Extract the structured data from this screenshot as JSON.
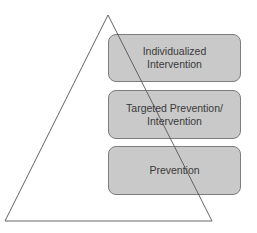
{
  "diagram": {
    "type": "pyramid-tiers",
    "shape": "triangle",
    "tiers": [
      {
        "label": "Individualized\nIntervention",
        "level": "top"
      },
      {
        "label": "Targeted Prevention/\nIntervention",
        "level": "middle"
      },
      {
        "label": "Prevention",
        "level": "bottom"
      }
    ],
    "colors": {
      "box_fill": "#c9c9c9",
      "box_border": "#7d7d7d",
      "text": "#3a3a3a",
      "triangle_stroke": "#555555",
      "background": "#ffffff"
    }
  }
}
